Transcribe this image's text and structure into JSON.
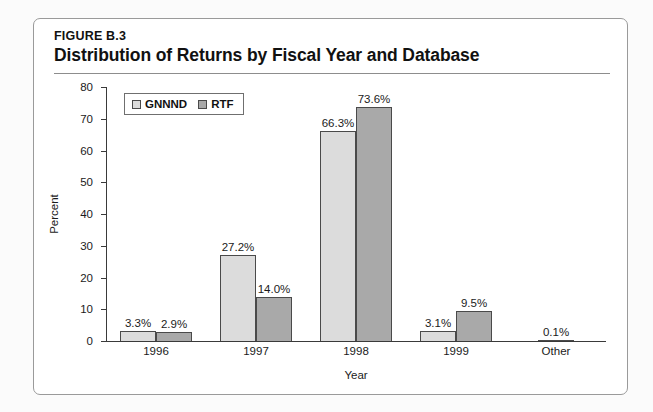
{
  "figure": {
    "label": "FIGURE B.3",
    "title": "Distribution of Returns by Fiscal Year and Database"
  },
  "colors": {
    "series_gnnnd": "#dcdcdc",
    "series_rtf": "#a9a9a9",
    "bar_border": "#4a4a4a",
    "axis": "#3a3a3a",
    "card_border": "#9a9a9a",
    "page_background": "#fbfbfb",
    "text": "#1b1b1b"
  },
  "chart_data": {
    "type": "bar",
    "title": "Distribution of Returns by Fiscal Year and Database",
    "subtitle": "FIGURE B.3",
    "xlabel": "Year",
    "ylabel": "Percent",
    "ylim": [
      0,
      80
    ],
    "yticks": [
      0,
      10,
      20,
      30,
      40,
      50,
      60,
      70,
      80
    ],
    "ytick_labels": [
      "0",
      "10",
      "20",
      "30",
      "40",
      "50",
      "60",
      "70",
      "80"
    ],
    "grid": false,
    "legend_position": "top-left",
    "categories": [
      "1996",
      "1997",
      "1998",
      "1999",
      "Other"
    ],
    "series": [
      {
        "name": "GNNND",
        "color": "#dcdcdc",
        "values": [
          3.3,
          27.2,
          66.3,
          3.1,
          0.1
        ],
        "labels": [
          "3.3%",
          "27.2%",
          "66.3%",
          "3.1%",
          "0.1%"
        ]
      },
      {
        "name": "RTF",
        "color": "#a9a9a9",
        "values": [
          2.9,
          14.0,
          73.6,
          9.5,
          null
        ],
        "labels": [
          "2.9%",
          "14.0%",
          "73.6%",
          "9.5%",
          ""
        ]
      }
    ]
  }
}
